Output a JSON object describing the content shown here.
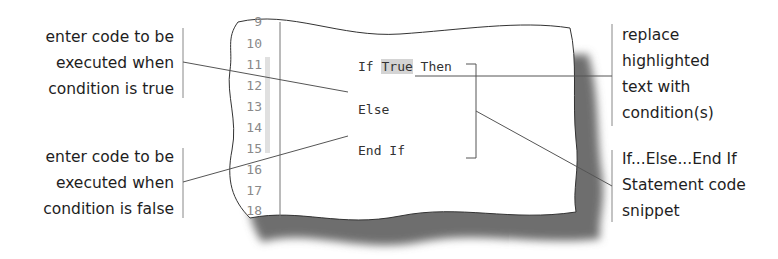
{
  "callouts": {
    "true_branch": {
      "lines": [
        "enter code to be",
        "executed when",
        "condition is true"
      ]
    },
    "false_branch": {
      "lines": [
        "enter code to be",
        "executed when",
        "condition is false"
      ]
    },
    "replace_condition": {
      "lines": [
        "replace",
        "highlighted",
        "text with",
        "condition(s)"
      ]
    },
    "snippet_label": {
      "lines": [
        "If...Else...End If",
        "Statement code",
        "snippet"
      ]
    }
  },
  "editor": {
    "line_numbers": [
      "9",
      "10",
      "11",
      "12",
      "13",
      "14",
      "15",
      "16",
      "17",
      "18"
    ],
    "code": {
      "if_keyword": "If ",
      "condition_placeholder": "True",
      "then_keyword": " Then",
      "else_line": "Else",
      "end_if_line": "End If"
    },
    "colors": {
      "highlight": "#d4d4d4",
      "change_bar": "#e0e0e0",
      "line_number": "#8a8a8a",
      "shadow": "#6e6e6e"
    }
  }
}
